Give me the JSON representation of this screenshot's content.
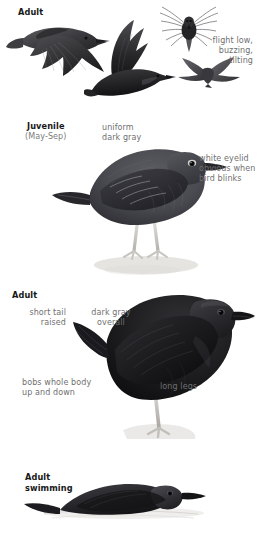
{
  "page": {
    "background": "#ffffff",
    "header_color": "#171717",
    "note_color": "#6f6f6f",
    "adult_plumage_color": "#1d1d1f",
    "juvenile_plumage_color": "#4b4b51",
    "leg_color": "#d8d6d2"
  },
  "panels": [
    {
      "id": "flight",
      "heading": "Adult",
      "notes": [
        {
          "id": "flight-style",
          "lines": [
            "flight low,",
            "buzzing,",
            "tilting"
          ],
          "align": "right"
        }
      ],
      "figures": [
        "dipper-in-flight-wings-down",
        "dipper-in-flight-wings-up",
        "dipper-flight-head-on",
        "dipper-flight-silhouette"
      ]
    },
    {
      "id": "juvenile",
      "heading": "Juvenile",
      "subheading": "(May-Sep)",
      "notes": [
        {
          "id": "uniform-dark-gray",
          "lines": [
            "uniform",
            "dark gray"
          ],
          "align": "left"
        },
        {
          "id": "white-eyelid",
          "lines": [
            "white eyelid",
            "obvious when",
            "bird blinks"
          ],
          "align": "left"
        }
      ],
      "figures": [
        "juvenile-dipper-standing"
      ]
    },
    {
      "id": "adult-standing",
      "heading": "Adult",
      "notes": [
        {
          "id": "short-tail",
          "lines": [
            "short tail",
            "raised"
          ],
          "align": "right"
        },
        {
          "id": "dark-gray-overall",
          "lines": [
            "dark gray",
            "overall"
          ],
          "align": "center"
        },
        {
          "id": "bobs-body",
          "lines": [
            "bobs whole body",
            "up and down"
          ],
          "align": "left"
        },
        {
          "id": "long-legs",
          "lines": [
            "long legs"
          ],
          "align": "left"
        }
      ],
      "figures": [
        "adult-dipper-standing"
      ]
    },
    {
      "id": "swimming",
      "heading_lines": [
        "Adult",
        "swimming"
      ],
      "notes": [],
      "figures": [
        "adult-dipper-swimming"
      ]
    }
  ],
  "labels": {
    "flight_heading": "Adult",
    "flight_note_1": "flight low,",
    "flight_note_2": "buzzing,",
    "flight_note_3": "tilting",
    "juvenile_heading": "Juvenile",
    "juvenile_sub": "(May-Sep)",
    "juv_note_1": "uniform",
    "juv_note_2": "dark gray",
    "juv_eyelid_1": "white eyelid",
    "juv_eyelid_2": "obvious when",
    "juv_eyelid_3": "bird blinks",
    "adult_heading": "Adult",
    "adult_tail_1": "short tail",
    "adult_tail_2": "raised",
    "adult_gray_1": "dark gray",
    "adult_gray_2": "overall",
    "adult_bobs_1": "bobs whole body",
    "adult_bobs_2": "up and down",
    "adult_legs": "long legs",
    "swim_heading_1": "Adult",
    "swim_heading_2": "swimming"
  }
}
